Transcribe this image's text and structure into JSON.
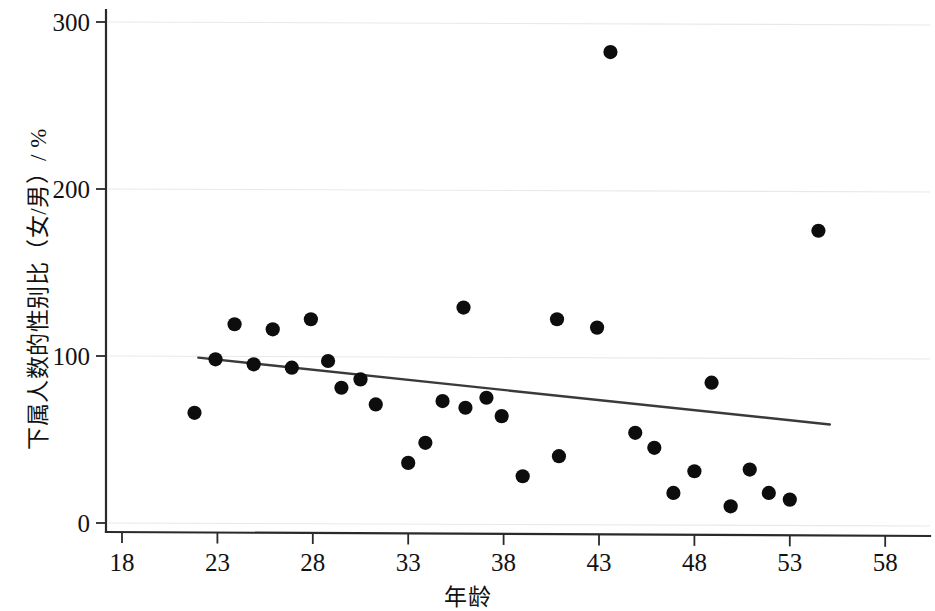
{
  "chart_data": {
    "type": "scatter",
    "title": "",
    "xlabel": "年龄",
    "ylabel": "下属人数的性别比（女/男）/ %",
    "xlim": [
      18,
      60.5
    ],
    "ylim": [
      0,
      310
    ],
    "xticks": [
      18,
      23,
      28,
      33,
      38,
      43,
      48,
      53,
      58
    ],
    "yticks": [
      0,
      100,
      200,
      300
    ],
    "grid": true,
    "legend": false,
    "series": [
      {
        "name": "下属人数的性别比",
        "marker": "filled-circle",
        "color": "#0d0d0d",
        "points": [
          {
            "x": 21.8,
            "y": 66
          },
          {
            "x": 22.9,
            "y": 98
          },
          {
            "x": 23.9,
            "y": 119
          },
          {
            "x": 24.9,
            "y": 95
          },
          {
            "x": 25.9,
            "y": 116
          },
          {
            "x": 26.9,
            "y": 93
          },
          {
            "x": 27.9,
            "y": 122
          },
          {
            "x": 28.8,
            "y": 97
          },
          {
            "x": 29.5,
            "y": 81
          },
          {
            "x": 30.5,
            "y": 86
          },
          {
            "x": 31.3,
            "y": 71
          },
          {
            "x": 33.0,
            "y": 36
          },
          {
            "x": 33.9,
            "y": 48
          },
          {
            "x": 34.8,
            "y": 73
          },
          {
            "x": 35.9,
            "y": 129
          },
          {
            "x": 36.0,
            "y": 69
          },
          {
            "x": 37.1,
            "y": 75
          },
          {
            "x": 37.9,
            "y": 64
          },
          {
            "x": 39.0,
            "y": 28
          },
          {
            "x": 40.8,
            "y": 122
          },
          {
            "x": 40.9,
            "y": 40
          },
          {
            "x": 42.9,
            "y": 117
          },
          {
            "x": 43.6,
            "y": 282
          },
          {
            "x": 44.9,
            "y": 54
          },
          {
            "x": 45.9,
            "y": 45
          },
          {
            "x": 46.9,
            "y": 18
          },
          {
            "x": 48.0,
            "y": 31
          },
          {
            "x": 48.9,
            "y": 84
          },
          {
            "x": 49.9,
            "y": 10
          },
          {
            "x": 50.9,
            "y": 32
          },
          {
            "x": 51.9,
            "y": 18
          },
          {
            "x": 53.0,
            "y": 14
          },
          {
            "x": 54.5,
            "y": 175
          }
        ]
      }
    ],
    "trendline": {
      "name": "线性拟合",
      "x_start": 22.0,
      "y_start": 99,
      "x_end": 55.1,
      "y_end": 59,
      "color": "#3a3a3a"
    }
  },
  "axes": {
    "y_tick_labels": [
      "300",
      "200",
      "100",
      "0"
    ],
    "x_tick_labels": [
      "18",
      "23",
      "28",
      "33",
      "38",
      "43",
      "48",
      "53",
      "58"
    ],
    "y_title": "下属人数的性别比（女/男）/ %",
    "x_title": "年龄"
  }
}
